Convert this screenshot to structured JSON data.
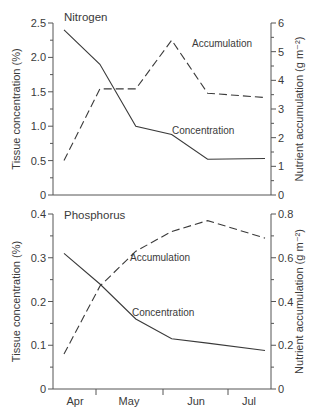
{
  "colors": {
    "axis": "#555555",
    "line": "#3a3a3a",
    "text": "#3a3a3a"
  },
  "x_axis": {
    "labels": [
      "Apr",
      "May",
      "Jun",
      "Jul"
    ]
  },
  "chart_data": [
    {
      "type": "line",
      "title": "Nitrogen",
      "xlabel": "",
      "ylabel": "Tissue concentration (%)",
      "y2label": "Nutrient accumulation (g m⁻²)",
      "ylim": [
        0,
        2.5
      ],
      "y2lim": [
        0,
        6
      ],
      "yticks": [
        "0",
        "0.5",
        "1.0",
        "1.5",
        "2.0",
        "2.5"
      ],
      "y2ticks": [
        "0",
        "1",
        "2",
        "3",
        "4",
        "5",
        "6"
      ],
      "grid": false,
      "x": [
        0.0,
        0.5,
        1.0,
        1.5,
        2.0,
        2.8
      ],
      "series": [
        {
          "name": "Concentration",
          "axis": "left",
          "style": "solid",
          "values": [
            2.4,
            1.9,
            1.0,
            0.88,
            0.52,
            0.53
          ]
        },
        {
          "name": "Accumulation",
          "axis": "right",
          "style": "dashed",
          "values": [
            1.2,
            3.7,
            3.7,
            5.4,
            3.55,
            3.4
          ]
        }
      ],
      "annotations": [
        "Accumulation",
        "Concentration"
      ]
    },
    {
      "type": "line",
      "title": "Phosphorus",
      "xlabel": "",
      "ylabel": "Tissue concentration (%)",
      "y2label": "Nutrient accumulation (g m⁻²)",
      "ylim": [
        0,
        0.4
      ],
      "y2lim": [
        0,
        0.8
      ],
      "yticks": [
        "0",
        "0.1",
        "0.2",
        "0.3",
        "0.4"
      ],
      "y2ticks": [
        "0",
        "0.2",
        "0.4",
        "0.6",
        "0.8"
      ],
      "grid": false,
      "x": [
        0.0,
        0.5,
        1.0,
        1.5,
        2.0,
        2.8
      ],
      "series": [
        {
          "name": "Concentration",
          "axis": "left",
          "style": "solid",
          "values": [
            0.31,
            0.24,
            0.16,
            0.115,
            0.105,
            0.088
          ]
        },
        {
          "name": "Accumulation",
          "axis": "right",
          "style": "dashed",
          "values": [
            0.16,
            0.47,
            0.63,
            0.72,
            0.77,
            0.69
          ]
        }
      ],
      "annotations": [
        "Accumulation",
        "Concentration"
      ]
    }
  ]
}
